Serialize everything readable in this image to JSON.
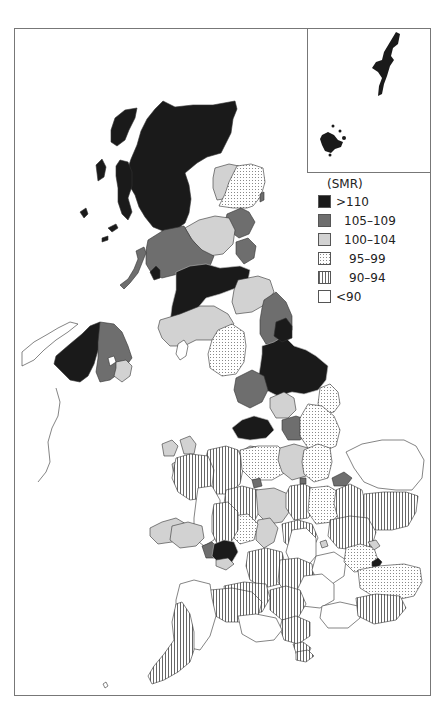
{
  "figure": {
    "type": "choropleth map",
    "region": "United Kingdom",
    "inset_label": "Orkney and Shetland inset"
  },
  "legend": {
    "title": "(SMR)",
    "items": [
      {
        "label": ">110",
        "fill": "#1a1a1a",
        "pattern": "solid"
      },
      {
        "label": "105–109",
        "fill": "#6e6e6e",
        "pattern": "solid"
      },
      {
        "label": "100–104",
        "fill": "#d2d2d2",
        "pattern": "solid"
      },
      {
        "label": "95–99",
        "fill": "#ffffff",
        "pattern": "dots"
      },
      {
        "label": "90–94",
        "fill": "#ffffff",
        "pattern": "vertical-lines"
      },
      {
        "label": "<90",
        "fill": "#ffffff",
        "pattern": "none"
      }
    ]
  },
  "colors": {
    "frame": "#777777",
    "outline": "#333333",
    "dark": "#1a1a1a",
    "mid": "#6e6e6e",
    "light": "#d2d2d2"
  }
}
